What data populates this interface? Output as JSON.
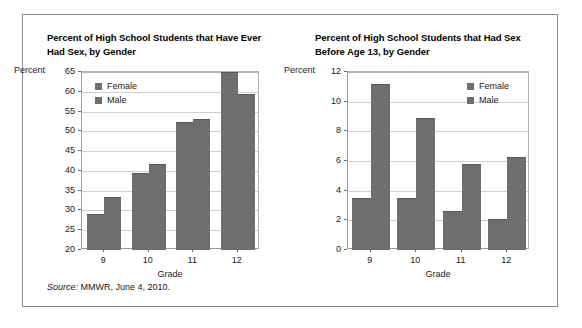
{
  "figure": {
    "source_prefix": "Source:",
    "source_text": "MMWR, June 4, 2010."
  },
  "chart_data": [
    {
      "type": "bar",
      "panel": "left",
      "title": "Percent of High School Students that Have Ever Had Sex, by Gender",
      "categories": [
        "9",
        "10",
        "11",
        "12"
      ],
      "series": [
        {
          "name": "Female",
          "values": [
            29.2,
            39.4,
            52.3,
            65.0
          ]
        },
        {
          "name": "Male",
          "values": [
            33.4,
            41.7,
            53.2,
            59.5
          ]
        }
      ],
      "xlabel": "Grade",
      "ylabel": "Percent",
      "ylim": [
        20,
        65
      ],
      "ytick_step": 5,
      "yticks": [
        20,
        25,
        30,
        35,
        40,
        45,
        50,
        55,
        60,
        65
      ],
      "grid": true,
      "legend_position": "top-left",
      "bar_color": "#6e6e6e"
    },
    {
      "type": "bar",
      "panel": "right",
      "title": "Percent of High School Students that Had Sex Before Age 13, by Gender",
      "categories": [
        "9",
        "10",
        "11",
        "12"
      ],
      "series": [
        {
          "name": "Female",
          "values": [
            3.5,
            3.5,
            2.6,
            2.1
          ]
        },
        {
          "name": "Male",
          "values": [
            11.2,
            8.9,
            5.8,
            6.3
          ]
        }
      ],
      "xlabel": "Grade",
      "ylabel": "Percent",
      "ylim": [
        0,
        12
      ],
      "ytick_step": 2,
      "yticks": [
        0,
        2,
        4,
        6,
        8,
        10,
        12
      ],
      "grid": true,
      "legend_position": "top-right",
      "bar_color": "#6e6e6e"
    }
  ]
}
